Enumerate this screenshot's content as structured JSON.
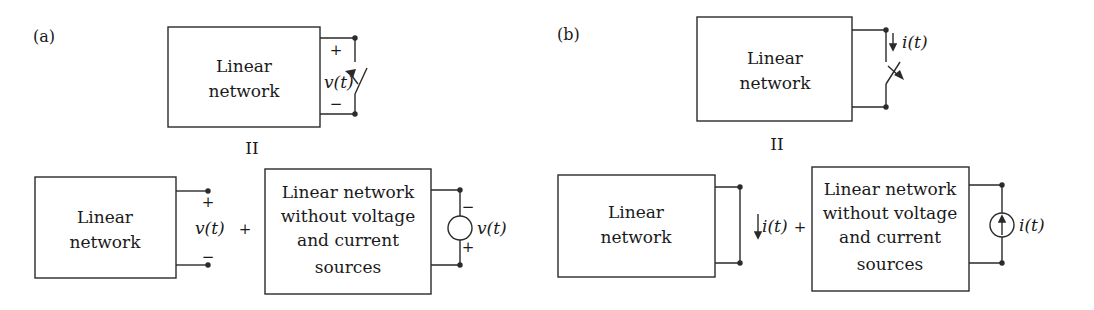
{
  "panels": {
    "a": {
      "label": "(a)",
      "top": {
        "network_line1": "Linear",
        "network_line2": "network",
        "plus": "+",
        "minus": "−",
        "voltage": "v(t)",
        "caption": "II"
      },
      "bottom_left": {
        "network_line1": "Linear",
        "network_line2": "network",
        "plus": "+",
        "minus": "−",
        "voltage": "v(t)"
      },
      "operator": "+",
      "bottom_right": {
        "line1": "Linear network",
        "line2": "without voltage",
        "line3": "and current",
        "line4": "sources",
        "source_minus": "−",
        "source_plus": "+",
        "voltage": "v(t)"
      }
    },
    "b": {
      "label": "(b)",
      "top": {
        "network_line1": "Linear",
        "network_line2": "network",
        "current": "i(t)",
        "caption": "II"
      },
      "bottom_left": {
        "network_line1": "Linear",
        "network_line2": "network",
        "current": "i(t)"
      },
      "operator": "+",
      "bottom_right": {
        "line1": "Linear network",
        "line2": "without voltage",
        "line3": "and current",
        "line4": "sources",
        "current": "i(t)"
      }
    }
  },
  "colors": {
    "stroke": "#2a2a2a",
    "text": "#1a1a1a",
    "background": "#ffffff"
  }
}
